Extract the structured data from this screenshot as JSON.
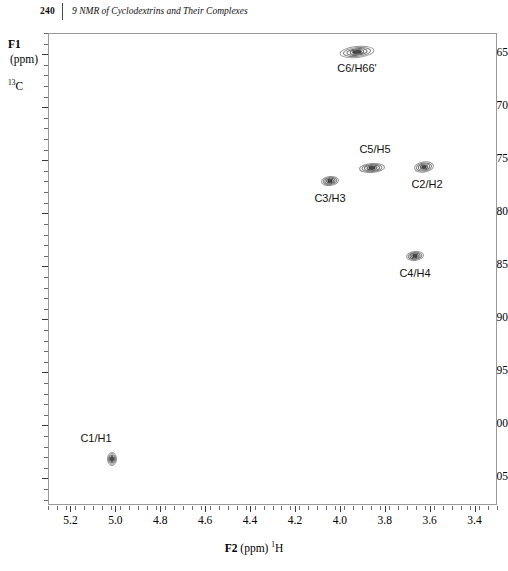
{
  "header": {
    "page_number": "240",
    "chapter_title": "9 NMR of Cyclodextrins and Their Complexes"
  },
  "axes": {
    "y_title": "F1",
    "y_unit": "(ppm)",
    "y_nucleus_sup": "13",
    "y_nucleus": "C",
    "x_label_main": "F2",
    "x_label_unit": "(ppm)",
    "x_nucleus_sup": "1",
    "x_nucleus": "H"
  },
  "chart_data": {
    "type": "scatter",
    "title": "",
    "xlabel": "F2 (ppm) 1H",
    "ylabel": "F1 (ppm) 13C",
    "xlim": [
      5.3,
      3.3
    ],
    "ylim": [
      63.0,
      107.5
    ],
    "x_reversed": true,
    "y_reversed": true,
    "grid": false,
    "legend_position": "none",
    "x_ticks": [
      "5.2",
      "5.0",
      "4.8",
      "4.6",
      "4.4",
      "4.2",
      "4.0",
      "3.8",
      "3.6",
      "3.4"
    ],
    "x_tick_values": [
      5.2,
      5.0,
      4.8,
      4.6,
      4.4,
      4.2,
      4.0,
      3.8,
      3.6,
      3.4
    ],
    "x_minor_step": 0.04,
    "y_ticks": [
      "65",
      "70",
      "75",
      "80",
      "85",
      "90",
      "95",
      "100",
      "105"
    ],
    "y_tick_values": [
      65,
      70,
      75,
      80,
      85,
      90,
      95,
      100,
      105
    ],
    "y_minor_step": 1,
    "peaks": [
      {
        "label": "C6/H66'",
        "x": 3.92,
        "y": 65.3,
        "w": 34,
        "h": 11,
        "rot": -6,
        "label_dx": 0,
        "label_dy": 11,
        "label_anchor": "below"
      },
      {
        "label": "C5/H5",
        "x": 3.84,
        "y": 78.2,
        "w": 24,
        "h": 9,
        "rot": -4,
        "label_dx": 2,
        "label_dy": -24,
        "label_anchor": "above"
      },
      {
        "label": "C2/H2",
        "x": 3.63,
        "y": 78.0,
        "w": 19,
        "h": 10,
        "rot": -8,
        "label_dx": 2,
        "label_dy": 10,
        "label_anchor": "below"
      },
      {
        "label": "C3/H3",
        "x": 3.84,
        "y": 79.5,
        "w": 17,
        "h": 9,
        "rot": -5,
        "label_dx": 0,
        "label_dy": 11,
        "label_anchor": "below",
        "x_px": 330
      },
      {
        "label": "C4/H4",
        "x": 3.56,
        "y": 84.2,
        "w": 17,
        "h": 9,
        "rot": -7,
        "label_dx": 0,
        "label_dy": 11,
        "label_anchor": "below"
      },
      {
        "label": "C1/H1",
        "x": 5.03,
        "y": 104.0,
        "w": 9,
        "h": 12,
        "rot": 0,
        "label_dx": -3,
        "label_dy": -27,
        "label_anchor": "above"
      }
    ],
    "peak_pixels": [
      {
        "label": "C6/H66'",
        "cx": 357,
        "cy": 52,
        "w": 34,
        "h": 11,
        "rot": -6,
        "lx": 357,
        "ly": 62
      },
      {
        "label": "C5/H5",
        "cx": 372,
        "cy": 168,
        "w": 25,
        "h": 9,
        "rot": -4,
        "lx": 375,
        "ly": 143
      },
      {
        "label": "C2/H2",
        "cx": 424,
        "cy": 167,
        "w": 19,
        "h": 10,
        "rot": -8,
        "lx": 427,
        "ly": 178
      },
      {
        "label": "C3/H3",
        "cx": 330,
        "cy": 181,
        "w": 17,
        "h": 9,
        "rot": -5,
        "lx": 330,
        "ly": 192
      },
      {
        "label": "C4/H4",
        "cx": 415,
        "cy": 256,
        "w": 17,
        "h": 9,
        "rot": -7,
        "lx": 415,
        "ly": 267
      },
      {
        "label": "C1/H1",
        "cx": 112,
        "cy": 459,
        "w": 9,
        "h": 13,
        "rot": 0,
        "lx": 96,
        "ly": 432
      }
    ],
    "peak_color": "#6e6e6e",
    "peak_core_color": "#3a3a3a"
  }
}
